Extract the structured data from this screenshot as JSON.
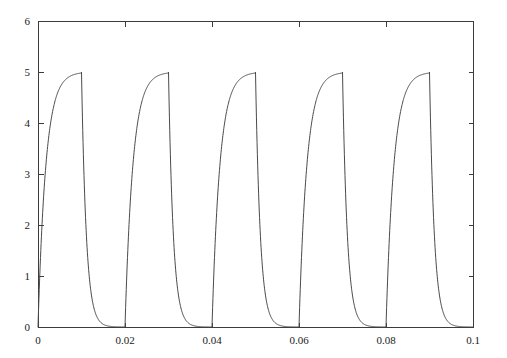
{
  "chart_data": {
    "type": "line",
    "title": "",
    "subtitle": "",
    "xlabel": "",
    "ylabel": "",
    "xlim": [
      0,
      0.1
    ],
    "ylim": [
      0,
      6
    ],
    "grid": false,
    "legend": null,
    "annotations": [],
    "x_ticks": [
      0,
      0.02,
      0.04,
      0.06,
      0.08,
      0.1
    ],
    "x_tick_labels": [
      "0",
      "0.02",
      "0.04",
      "0.06",
      "0.08",
      "0.1"
    ],
    "y_ticks": [
      0,
      1,
      2,
      3,
      4,
      5,
      6
    ],
    "y_tick_labels": [
      "0",
      "1",
      "2",
      "3",
      "4",
      "5",
      "6"
    ],
    "line_color": "#4a4a4a",
    "axis_color": "#3c3c3c",
    "background_color": "#ffffff",
    "waveform": {
      "description": "Periodic capacitor charge-discharge waveform",
      "period": 0.02,
      "pulse_count": 5,
      "peak_value": 5,
      "baseline_value": 0,
      "charge_start_times": [
        0,
        0.02,
        0.04,
        0.06,
        0.08
      ],
      "discharge_start_times": [
        0.01,
        0.03,
        0.05,
        0.07,
        0.09
      ],
      "charge_time_constant": 0.0018,
      "discharge_time_constant": 0.0011,
      "samples_per_segment": 140
    },
    "series": [
      {
        "name": "v(t)",
        "x": [
          0,
          0.002,
          0.004,
          0.006,
          0.008,
          0.01,
          0.011,
          0.012,
          0.013,
          0.014,
          0.016,
          0.018,
          0.02,
          0.022,
          0.024,
          0.026,
          0.028,
          0.03,
          0.031,
          0.032,
          0.033,
          0.034,
          0.036,
          0.038,
          0.04,
          0.042,
          0.044,
          0.046,
          0.048,
          0.05,
          0.051,
          0.052,
          0.053,
          0.054,
          0.056,
          0.058,
          0.06,
          0.062,
          0.064,
          0.066,
          0.068,
          0.07,
          0.071,
          0.072,
          0.073,
          0.074,
          0.076,
          0.078,
          0.08,
          0.082,
          0.084,
          0.086,
          0.088,
          0.09,
          0.091,
          0.092,
          0.093,
          0.094,
          0.096,
          0.098,
          0.1
        ],
        "y": [
          0,
          3.34,
          4.44,
          4.82,
          4.94,
          5,
          1.99,
          0.79,
          0.31,
          0.12,
          0.02,
          0,
          0,
          3.34,
          4.44,
          4.82,
          4.94,
          5,
          1.99,
          0.79,
          0.31,
          0.12,
          0.02,
          0,
          0,
          3.34,
          4.44,
          4.82,
          4.94,
          5,
          1.99,
          0.79,
          0.31,
          0.12,
          0.02,
          0,
          0,
          3.34,
          4.44,
          4.82,
          4.94,
          5,
          1.99,
          0.79,
          0.31,
          0.12,
          0.02,
          0,
          0,
          3.34,
          4.44,
          4.82,
          4.94,
          5,
          1.99,
          0.79,
          0.31,
          0.12,
          0.02,
          0,
          0
        ]
      }
    ]
  },
  "axes": {
    "left_px": 38,
    "right_px": 473,
    "top_px": 21,
    "bottom_px": 327
  }
}
